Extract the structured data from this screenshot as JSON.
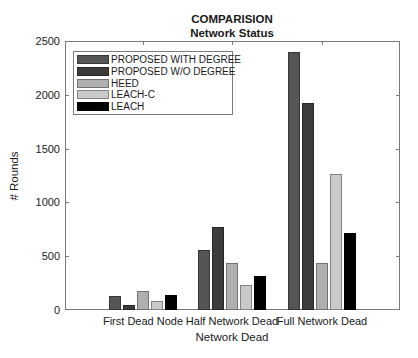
{
  "chart_data": {
    "type": "bar",
    "title": "COMPARISION",
    "subtitle": "Network Status",
    "xlabel": "Network Dead",
    "ylabel": "# Rounds",
    "ylim": [
      0,
      2500
    ],
    "yticks": [
      0,
      500,
      1000,
      1500,
      2000,
      2500
    ],
    "grid": false,
    "legend_position": "upper left",
    "categories": [
      "First Dead Node",
      "Half Network Dead",
      "Full Network Dead"
    ],
    "series": [
      {
        "name": "PROPOSED WITH DEGREE",
        "color": "#555555",
        "values": [
          130,
          560,
          2400
        ]
      },
      {
        "name": "PROPOSED W/O DEGREE",
        "color": "#3c3c3c",
        "values": [
          45,
          775,
          1925
        ]
      },
      {
        "name": "HEED",
        "color": "#b0b0b0",
        "values": [
          180,
          435,
          435
        ]
      },
      {
        "name": "LEACH-C",
        "color": "#cacaca",
        "values": [
          80,
          235,
          1265
        ]
      },
      {
        "name": "LEACH",
        "color": "#000000",
        "values": [
          140,
          315,
          720
        ]
      }
    ]
  }
}
